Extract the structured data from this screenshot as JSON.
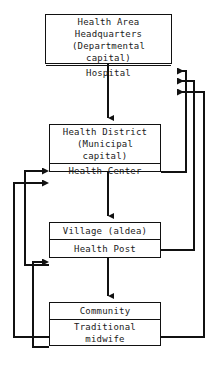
{
  "diagram": {
    "type": "flowchart",
    "stroke_color": "#111111",
    "background_color": "#ffffff",
    "nodes": [
      {
        "id": "health-area",
        "upper_label": "Health Area\nHeadquarters\n(Departmental\ncapital)",
        "lower_label": "Hospital"
      },
      {
        "id": "health-district",
        "upper_label": "Health District\n(Municipal\ncapital)",
        "lower_label": "Health Center"
      },
      {
        "id": "village",
        "upper_label": "Village (aldea)",
        "lower_label": "Health Post"
      },
      {
        "id": "community",
        "upper_label": "Community",
        "lower_label": "Traditional\nmidwife"
      }
    ],
    "connectors": [
      {
        "id": "down-hospital-to-district",
        "from": "hospital",
        "to": "health-district",
        "direction": "down"
      },
      {
        "id": "down-healthcenter-to-village",
        "from": "health-center",
        "to": "village",
        "direction": "down"
      },
      {
        "id": "down-healthpost-to-community",
        "from": "health-post",
        "to": "community",
        "direction": "down"
      },
      {
        "id": "up-healthcenter-to-hospital",
        "from": "health-center",
        "to": "hospital",
        "direction": "up-right"
      },
      {
        "id": "up-healthpost-to-hospital",
        "from": "health-post",
        "to": "hospital",
        "direction": "up-right"
      },
      {
        "id": "up-midwife-to-hospital",
        "from": "traditional-midwife",
        "to": "hospital",
        "direction": "up-right"
      },
      {
        "id": "up-healthpost-to-healthcenter",
        "from": "health-post",
        "to": "health-center",
        "direction": "up-left"
      },
      {
        "id": "up-midwife-to-healthcenter",
        "from": "traditional-midwife",
        "to": "health-center",
        "direction": "up-left"
      },
      {
        "id": "up-midwife-to-healthpost",
        "from": "traditional-midwife",
        "to": "health-post",
        "direction": "up-left"
      }
    ]
  }
}
